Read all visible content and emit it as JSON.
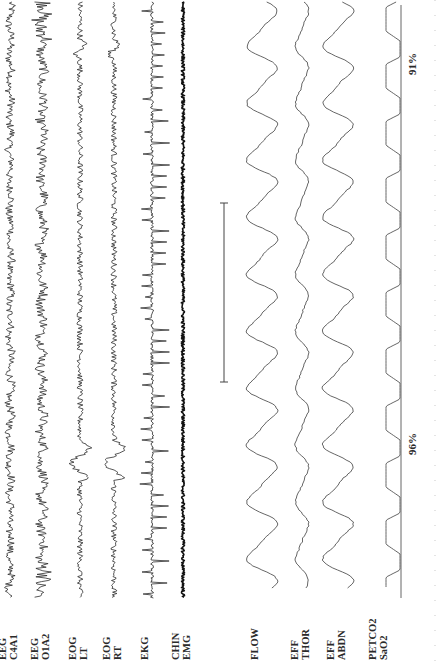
{
  "figure": {
    "orientation": "rotated-90-ccw",
    "channels": [
      {
        "id": "eeg_c4a1",
        "label_line1": "EEG",
        "label_line2": "C4A1",
        "x": 10,
        "type": "eeg",
        "amp": 4
      },
      {
        "id": "eeg_o1a2",
        "label_line1": "EEG",
        "label_line2": "O1A2",
        "x": 42,
        "type": "eeg",
        "amp": 5
      },
      {
        "id": "eog_lt",
        "label_line1": "EOG",
        "label_line2": "LT",
        "x": 80,
        "type": "eog",
        "amp": 3
      },
      {
        "id": "eog_rt",
        "label_line1": "EOG",
        "label_line2": "RT",
        "x": 114,
        "type": "eog",
        "amp": 3
      },
      {
        "id": "ekg",
        "label_line1": "EKG",
        "label_line2": "",
        "x": 152,
        "type": "ekg",
        "amp": 8
      },
      {
        "id": "chin_emg",
        "label_line1": "CHIN",
        "label_line2": "EMG",
        "x": 183,
        "type": "emg",
        "amp": 1.6
      },
      {
        "id": "flow",
        "label_line1": "FLOW",
        "label_line2": "",
        "x": 262,
        "type": "resp",
        "amp": 14
      },
      {
        "id": "eff_thor",
        "label_line1": "EFF",
        "label_line2": "THOR",
        "x": 302,
        "type": "resp",
        "amp": 6
      },
      {
        "id": "eff_abdn",
        "label_line1": "EFF",
        "label_line2": "ABDN",
        "x": 338,
        "type": "resp",
        "amp": 14
      },
      {
        "id": "petco2",
        "label_line1": "PETCO2",
        "label_line2": "SaO2",
        "x": 392,
        "type": "capno",
        "amp": 14
      }
    ],
    "sao2_annotations": [
      {
        "text": "96%",
        "y": 455
      },
      {
        "text": "91%",
        "y": 75
      }
    ],
    "scale_bar": {
      "x": 224,
      "y_start": 203,
      "y_end": 382
    },
    "colors": {
      "trace": "#2b2b2b",
      "resp_trace": "#555555",
      "background": "#ffffff"
    }
  }
}
